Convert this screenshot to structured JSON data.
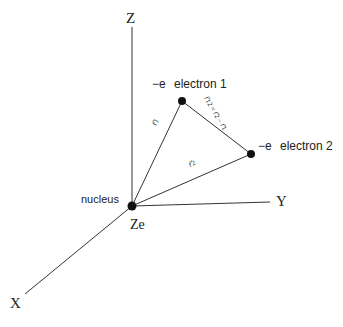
{
  "diagram": {
    "axes": {
      "z_label": "Z",
      "y_label": "Y",
      "x_label": "X"
    },
    "nucleus": {
      "label": "nucleus",
      "charge": "Ze"
    },
    "electron1": {
      "charge": "−e",
      "label": "electron 1"
    },
    "electron2": {
      "charge": "−e",
      "label": "electron 2"
    },
    "vectors": {
      "r1": "r⃗1",
      "r2": "r⃗2",
      "r12": "r⃗12 = r⃗2 − r⃗1"
    },
    "colors": {
      "line": "#333333",
      "dot": "#111111",
      "background": "#ffffff"
    }
  }
}
